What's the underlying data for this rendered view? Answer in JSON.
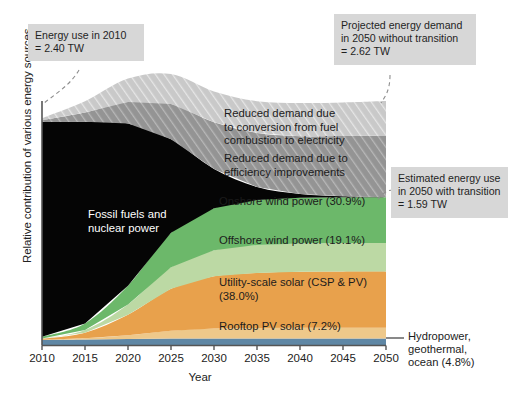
{
  "figure": {
    "xlabel": "Year",
    "ylabel": "Relative contribution of various energy sources"
  },
  "axis": {
    "xticks": [
      "2010",
      "2015",
      "2020",
      "2025",
      "2030",
      "2035",
      "2040",
      "2045",
      "2050"
    ]
  },
  "callouts": {
    "energy_use_2010": "Energy use in 2010\n= 2.40 TW",
    "projected_2050_without": "Projected energy demand\nin 2050 without transition\n= 2.62 TW",
    "estimated_2050_with": "Estimated energy use\nin 2050 with transition\n= 1.59 TW"
  },
  "band_labels": {
    "conversion": "Reduced demand due\nto conversion from fuel\ncombustion to electricity",
    "efficiency": "Reduced demand due to\nefficiency improvements",
    "fossil": "Fossil fuels and\nnuclear power",
    "onshore_wind": "Onshore wind power (30.9%)",
    "offshore_wind": "Offshore wind power (19.1%)",
    "utility_solar": "Utility-scale solar (CSP & PV)\n(38.0%)",
    "rooftop_pv": "Rooftop PV solar (7.2%)",
    "hydro": "Hydropower,\ngeothermal,\nocean (4.8%)"
  },
  "colors": {
    "fossil": "#050505",
    "onshore_wind": "#6cb86a",
    "offshore_wind": "#bcd9a4",
    "utility_solar": "#e8a14c",
    "rooftop_pv": "#eec88a",
    "hydro": "#5f87a5",
    "reduced_conversion": "#c9c9c9",
    "reduced_efficiency": "#9a9a9a",
    "callout_bg": "#d7d7d7"
  },
  "chart_data": {
    "type": "area",
    "title": "",
    "xlabel": "Year",
    "ylabel": "Relative contribution of various energy sources",
    "x": [
      2010,
      2015,
      2020,
      2025,
      2030,
      2035,
      2040,
      2045,
      2050
    ],
    "xlim": [
      2010,
      2050
    ],
    "ylim": [
      0,
      2.62
    ],
    "grid": false,
    "legend": "in-plot labels",
    "units": "TW",
    "key_values": {
      "energy_use_2010_TW": 2.4,
      "projected_demand_2050_no_transition_TW": 2.62,
      "estimated_energy_use_2050_with_transition_TW": 1.59
    },
    "shares_2050_percent": {
      "onshore_wind": 30.9,
      "offshore_wind": 19.1,
      "utility_scale_solar_csp_pv": 38.0,
      "rooftop_pv_solar": 7.2,
      "hydropower_geothermal_ocean": 4.8
    },
    "series": [
      {
        "name": "Hydropower, geothermal, ocean",
        "color": "#5f87a5",
        "values": [
          0.06,
          0.065,
          0.07,
          0.074,
          0.076,
          0.076,
          0.076,
          0.076,
          0.076
        ]
      },
      {
        "name": "Rooftop PV solar",
        "color": "#eec88a",
        "values": [
          0.002,
          0.012,
          0.04,
          0.085,
          0.106,
          0.112,
          0.114,
          0.114,
          0.114
        ]
      },
      {
        "name": "Utility-scale solar (CSP & PV)",
        "color": "#e8a14c",
        "values": [
          0.01,
          0.06,
          0.22,
          0.45,
          0.56,
          0.59,
          0.6,
          0.604,
          0.604
        ]
      },
      {
        "name": "Offshore wind power",
        "color": "#bcd9a4",
        "values": [
          0.003,
          0.03,
          0.11,
          0.23,
          0.28,
          0.3,
          0.303,
          0.304,
          0.304
        ]
      },
      {
        "name": "Onshore wind power",
        "color": "#6cb86a",
        "values": [
          0.02,
          0.07,
          0.2,
          0.37,
          0.45,
          0.48,
          0.49,
          0.491,
          0.491
        ]
      },
      {
        "name": "Fossil fuels and nuclear power",
        "color": "#050505",
        "values": [
          2.3,
          2.16,
          1.74,
          1.0,
          0.42,
          0.14,
          0.04,
          0.01,
          0.0
        ]
      },
      {
        "name": "Reduced demand due to efficiency improvements",
        "color": "#9a9a9a",
        "values": [
          0.02,
          0.1,
          0.23,
          0.38,
          0.5,
          0.58,
          0.62,
          0.645,
          0.66
        ]
      },
      {
        "name": "Reduced demand due to conversion from fuel combustion to electricity",
        "color": "#c9c9c9",
        "values": [
          0.02,
          0.12,
          0.25,
          0.32,
          0.33,
          0.34,
          0.355,
          0.36,
          0.37
        ]
      }
    ]
  }
}
